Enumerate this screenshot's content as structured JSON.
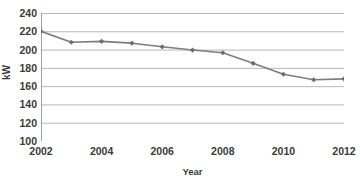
{
  "chart_data": {
    "type": "line",
    "title": "",
    "subtitle": "",
    "xlabel": "Year",
    "ylabel": "kW",
    "x": [
      2002,
      2003,
      2004,
      2005,
      2006,
      2007,
      2008,
      2009,
      2010,
      2011,
      2012
    ],
    "values": [
      220,
      208,
      209,
      207,
      203,
      199.5,
      196.5,
      185,
      173,
      167,
      168
    ],
    "series": [
      {
        "name": "kW",
        "values": [
          220,
          208,
          209,
          207,
          203,
          199.5,
          196.5,
          185,
          173,
          167,
          168
        ]
      }
    ],
    "xlim": [
      2002,
      2012
    ],
    "ylim": [
      100,
      240
    ],
    "y_ticks": [
      240,
      220,
      200,
      180,
      160,
      140,
      120,
      100
    ],
    "x_ticks": [
      2002,
      2004,
      2006,
      2008,
      2010,
      2012
    ],
    "x_tick_labels": [
      "2002",
      "2004",
      "2006",
      "2008",
      "2010",
      "2012"
    ],
    "y_tick_labels": [
      "240",
      "220",
      "200",
      "180",
      "160",
      "140",
      "120",
      "100"
    ],
    "grid": "horizontal",
    "legend": "none",
    "marker": "diamond",
    "line_color": "#7d7d7d",
    "marker_color": "#6e6e6e",
    "grid_color": "#b7b7b7",
    "axis_color": "#a0a0a0",
    "background": "#ffffff",
    "text_color": "#3a3a3a"
  }
}
